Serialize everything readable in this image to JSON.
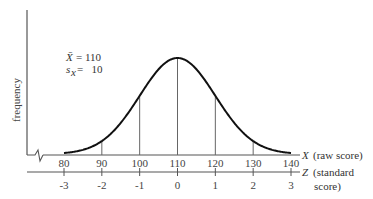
{
  "chart_data": {
    "type": "line",
    "title": "",
    "ylabel": "frequency",
    "x_axis": {
      "label_symbol": "X",
      "label_text": "(raw score)",
      "ticks": [
        80,
        90,
        100,
        110,
        120,
        130,
        140
      ],
      "range": [
        80,
        140
      ]
    },
    "z_axis": {
      "label_symbol": "Z",
      "label_text_line1": "(standard",
      "label_text_line2": "score)",
      "ticks": [
        -3,
        -2,
        -1,
        0,
        1,
        2,
        3
      ]
    },
    "distribution": {
      "name": "normal",
      "mean": 110,
      "sd": 10
    },
    "vertical_lines_at": [
      90,
      100,
      110,
      120,
      130
    ],
    "annotation": {
      "mean_symbol": "X̄",
      "mean_text": "= 110",
      "sd_symbol": "s",
      "sd_subscript": "x",
      "sd_text": "=   10"
    },
    "axis_break": true,
    "grid": false,
    "legend": "none"
  }
}
